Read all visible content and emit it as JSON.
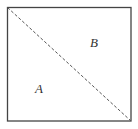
{
  "diagram": {
    "shape": "square",
    "square": {
      "x1": 7,
      "y1": 7,
      "x2": 131,
      "y2": 121,
      "stroke": "#444444"
    },
    "diagonal": {
      "from": "top-left",
      "to": "bottom-right",
      "style": "dashed",
      "stroke": "#555555"
    },
    "regions": [
      {
        "id": "A",
        "label": "A",
        "position": "lower-left triangle"
      },
      {
        "id": "B",
        "label": "B",
        "position": "upper-right triangle"
      }
    ]
  }
}
